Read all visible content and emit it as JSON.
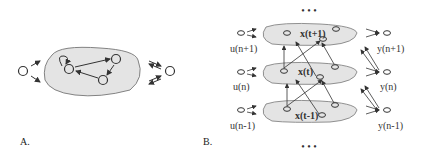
{
  "panels": {
    "a": {
      "label": "A."
    },
    "b": {
      "label": "B."
    }
  },
  "panel_b": {
    "ellipsis_top": "• • •",
    "ellipsis_bottom": "• • •",
    "states": {
      "top": "x(t+1)",
      "mid": "x(t)",
      "bot": "x(t-1)"
    },
    "inputs": [
      "u(n+1)",
      "u(n)",
      "u(n-1)"
    ],
    "outputs": [
      "y(n+1)",
      "y(n)",
      "y(n-1)"
    ]
  },
  "colors": {
    "blob_fill": "#e4e4e4",
    "stroke": "#333333"
  }
}
